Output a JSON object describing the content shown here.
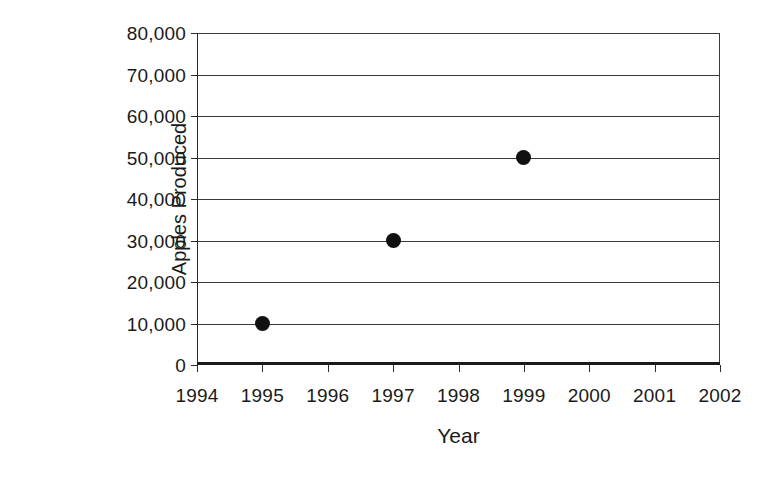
{
  "chart_data": {
    "type": "scatter",
    "title": "",
    "xlabel": "Year",
    "ylabel": "Apples Produced",
    "x": [
      1995,
      1997,
      1999
    ],
    "values": [
      10000,
      30000,
      50000
    ],
    "points": [
      {
        "x": 1995,
        "y": 10000
      },
      {
        "x": 1997,
        "y": 30000
      },
      {
        "x": 1999,
        "y": 50000
      }
    ],
    "xlim": [
      1994,
      2002
    ],
    "ylim": [
      0,
      80000
    ],
    "x_tick_labels": [
      "1994",
      "1995",
      "1996",
      "1997",
      "1998",
      "1999",
      "2000",
      "2001",
      "2002"
    ],
    "x_ticks": [
      1994,
      1995,
      1996,
      1997,
      1998,
      1999,
      2000,
      2001,
      2002
    ],
    "y_tick_labels": [
      "0",
      "10,000",
      "20,000",
      "30,000",
      "40,000",
      "50,000",
      "60,000",
      "70,000",
      "80,000"
    ],
    "y_ticks": [
      0,
      10000,
      20000,
      30000,
      40000,
      50000,
      60000,
      70000,
      80000
    ],
    "grid": "horizontal",
    "legend": "none",
    "marker": "filled-circle",
    "marker_color": "#111111",
    "grid_color": "#3a3a3a",
    "axis_color": "#1b1b1b",
    "background_color": "#ffffff"
  }
}
